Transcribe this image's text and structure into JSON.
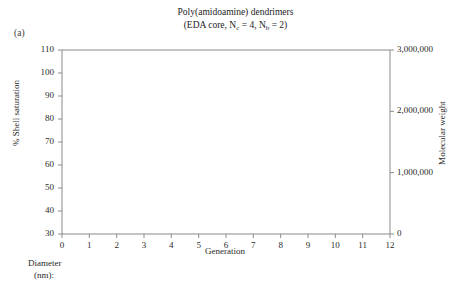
{
  "figure": {
    "panel_label": "(a)",
    "title": "Poly(amidoamine) dendrimers",
    "subtitle_pre": "(EDA core, N",
    "subtitle_sub1": "c",
    "subtitle_mid": " = 4, N",
    "subtitle_sub2": "b",
    "subtitle_post": " = 2)"
  },
  "diameter_row": {
    "label_line1": "Diameter",
    "label_line2": "(nm):",
    "values": [
      "1.4",
      "1.9",
      "2.6",
      "3.6",
      "4.4",
      "5.7",
      "7.2",
      "8.8",
      "11.4",
      "13.0"
    ],
    "values_full": [
      "1.4",
      "1.9",
      "2.6",
      "3.6",
      "4.4",
      "5.7",
      "7.2",
      "8.8",
      "9.8",
      "11.4",
      "13.0"
    ]
  },
  "chart_data": {
    "type": "line",
    "title": "Poly(amidoamine) dendrimers",
    "subtitle": "(EDA core, Nc = 4, Nb = 2)",
    "xlabel": "Generation",
    "ylabel": "% Shell saturation",
    "y2label": "Molecular weight",
    "xlim": [
      0,
      12
    ],
    "ylim": [
      30,
      110
    ],
    "y2lim": [
      0,
      3000000
    ],
    "xticks": [
      0,
      1,
      2,
      3,
      4,
      5,
      6,
      7,
      8,
      9,
      10,
      11,
      12
    ],
    "xtick_labels": [
      "0",
      "1",
      "2",
      "3",
      "4",
      "5",
      "6",
      "7",
      "8",
      "9",
      "10",
      "11",
      "12"
    ],
    "yticks": [
      30,
      40,
      50,
      60,
      70,
      80,
      90,
      100,
      110
    ],
    "ytick_labels": [
      "30",
      "40",
      "50",
      "60",
      "70",
      "80",
      "90",
      "100",
      "110"
    ],
    "y2ticks": [
      0,
      1000000,
      2000000,
      3000000
    ],
    "y2tick_labels": [
      "0",
      "1,000,000",
      "2,000,000",
      "3,000,000"
    ],
    "grid": false,
    "legend": "inline-annotations",
    "secondary_axis_label_unit": "Diameter (nm)",
    "series": [
      {
        "name": "% Shell saturation",
        "axis": "left",
        "marker": "filled-circle",
        "x": [
          1,
          2,
          3,
          4,
          5,
          6,
          7,
          8,
          9,
          10
        ],
        "values": [
          100,
          100,
          99.5,
          98,
          91,
          86.5,
          86.5,
          81,
          75,
          68
        ]
      },
      {
        "name": "Theoretical",
        "axis": "right",
        "marker": "filled-circle",
        "x": [
          3,
          4,
          5,
          6,
          7,
          8,
          9,
          10
        ],
        "values": [
          10000,
          20000,
          40000,
          80000,
          160000,
          300000,
          560000,
          930000
        ]
      },
      {
        "name": "Observed",
        "axis": "right",
        "marker": "filled-circle",
        "x": [
          3,
          4,
          5,
          6,
          7,
          8,
          9,
          10
        ],
        "values": [
          10000,
          18000,
          32000,
          62000,
          120000,
          240000,
          410000,
          700000
        ]
      }
    ],
    "annotations": [
      {
        "text": "Theoretical",
        "x": 9.05,
        "y2": 1020000
      },
      {
        "text": "Observed",
        "x": 9.1,
        "y2": 300000
      }
    ],
    "reference_lines": [
      {
        "type": "vertical",
        "x": 4,
        "from_y": 30,
        "to_y": 98
      },
      {
        "type": "vertical",
        "x": 7,
        "from_y": 30,
        "to_y": 86.5
      }
    ]
  }
}
